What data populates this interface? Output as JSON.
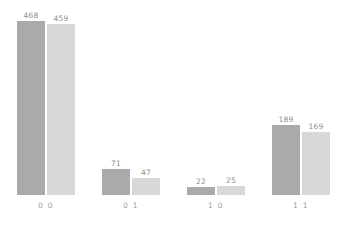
{
  "chart_data": {
    "type": "bar",
    "title": "",
    "subtitle": "",
    "xlabel": "",
    "ylabel": "",
    "categories": [
      "0 0",
      "0 1",
      "1 0",
      "1 1"
    ],
    "series": [
      {
        "name": "series-1",
        "color": "#aaaaab",
        "values": [
          468,
          71,
          22,
          189
        ]
      },
      {
        "name": "series-2",
        "color": "#d8d8d8",
        "values": [
          459,
          47,
          25,
          169
        ]
      }
    ],
    "ylim": [
      0,
      468
    ],
    "grid": false,
    "legend": false,
    "legend_position": "none",
    "value_labels": true,
    "background_color": "#ffffff",
    "label_color": "#8d8d8d",
    "tick_color": "#9a9a9a",
    "annotations": []
  },
  "labels": {
    "g0s0": "468",
    "g0s1": "459",
    "g1s0": "71",
    "g1s1": "47",
    "g2s0": "22",
    "g2s1": "25",
    "g3s0": "189",
    "g3s1": "169",
    "t0": "0 0",
    "t1": "0 1",
    "t2": "1 0",
    "t3": "1 1"
  }
}
